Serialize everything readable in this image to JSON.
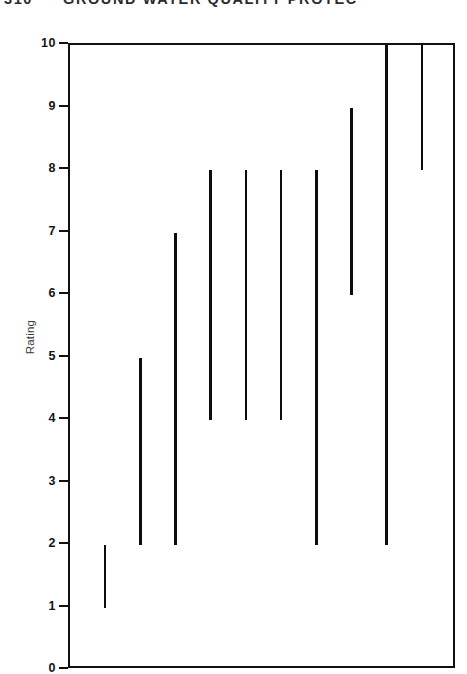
{
  "page_header": {
    "folio": "310",
    "running_title": "GROUND WATER QUALITY PROTEC"
  },
  "chart_data": {
    "type": "bar",
    "subtype": "range-bar",
    "title": "",
    "xlabel": "",
    "ylabel": "Rating",
    "ylim": [
      0,
      10
    ],
    "xlim": [
      0,
      11
    ],
    "grid": false,
    "legend": null,
    "y_ticks": [
      0,
      1,
      2,
      3,
      4,
      5,
      6,
      7,
      8,
      9,
      10
    ],
    "y_tick_labels": [
      "0",
      "1",
      "2",
      "3",
      "4",
      "5",
      "6",
      "7",
      "8",
      "9",
      "10"
    ],
    "x_ticks": [],
    "x_tick_labels": [],
    "categories": [
      "1",
      "2",
      "3",
      "4",
      "5",
      "6",
      "7",
      "8",
      "9",
      "10"
    ],
    "series": [
      {
        "name": "Rating range",
        "type": "range",
        "bars": [
          {
            "index": 1,
            "x": 1,
            "low": 1,
            "high": 2
          },
          {
            "index": 2,
            "x": 2,
            "low": 2,
            "high": 5
          },
          {
            "index": 3,
            "x": 3,
            "low": 2,
            "high": 7
          },
          {
            "index": 4,
            "x": 4,
            "low": 4,
            "high": 8
          },
          {
            "index": 5,
            "x": 5,
            "low": 4,
            "high": 8
          },
          {
            "index": 6,
            "x": 6,
            "low": 4,
            "high": 8
          },
          {
            "index": 7,
            "x": 7,
            "low": 2,
            "high": 8
          },
          {
            "index": 8,
            "x": 8,
            "low": 6,
            "high": 9
          },
          {
            "index": 9,
            "x": 9,
            "low": 2,
            "high": 10
          },
          {
            "index": 10,
            "x": 10,
            "low": 8,
            "high": 10
          }
        ]
      }
    ],
    "colors": {
      "bar": "#0d0d0d",
      "axis": "#111111",
      "background": "#ffffff"
    }
  }
}
